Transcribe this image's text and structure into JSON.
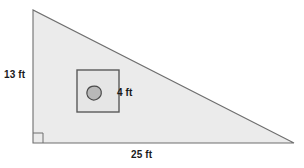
{
  "figure": {
    "type": "right-triangle-with-inscribed-square",
    "title": "",
    "colors": {
      "triangle_fill": "#ebebeb",
      "triangle_stroke": "#6e6e6e",
      "square_fill": "#e6e6e6",
      "square_stroke": "#5a5a5a",
      "blob_fill": "#b8b8b8",
      "blob_stroke": "#4a4a4a",
      "label_color": "#1a1a1a",
      "background": "#ffffff"
    },
    "triangle": {
      "name": "right-triangle",
      "vertices": [
        {
          "label": "apex",
          "x": 33,
          "y": 10
        },
        {
          "label": "right-angle-corner",
          "x": 33,
          "y": 143
        },
        {
          "label": "far-corner",
          "x": 294,
          "y": 143
        }
      ],
      "right_angle_at": "bottom-left",
      "height_label": "13 ft",
      "height_value": 13,
      "base_label": "25 ft",
      "base_value": 25,
      "units": "ft"
    },
    "square": {
      "name": "inscribed-square",
      "x": 77,
      "y": 70,
      "size": 42,
      "side_label": "4 ft",
      "side_value": 4,
      "units": "ft"
    },
    "blob": {
      "name": "pebble-shape",
      "cx": 94,
      "cy": 93,
      "rx": 7,
      "ry": 7
    },
    "right_angle_marker": {
      "name": "right-angle-marker",
      "x": 33,
      "y": 133,
      "size": 10
    }
  },
  "labels": {
    "height": "13 ft",
    "square_side": "4 ft",
    "base": "25 ft"
  }
}
